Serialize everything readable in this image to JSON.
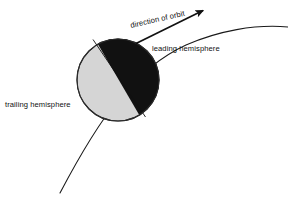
{
  "diagram": {
    "background_color": "#ffffff",
    "labels": {
      "direction_of_orbit": "direction of orbit",
      "leading_hemisphere": "leading hemisphere",
      "trailing_hemisphere": "trailing hemisphere"
    },
    "body": {
      "name": "orbiting-body",
      "center_x": 118,
      "center_y": 80,
      "radius": 41,
      "leading_fill": "#111111",
      "trailing_fill": "#d5d5d5",
      "outline_color": "#2b2b2b"
    },
    "orbit": {
      "name": "orbit-path",
      "stroke": "#1a1a1a",
      "stroke_width": 1.1
    },
    "arrow": {
      "name": "direction-arrow",
      "stroke": "#111111",
      "stroke_width": 1.6,
      "text_rotation_degrees": -13
    }
  }
}
